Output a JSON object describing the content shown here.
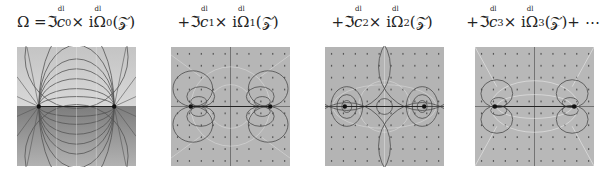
{
  "figure": {
    "panels": [
      {
        "id": "p0",
        "caption": {
          "prefix": "Ω = ",
          "op": "ℑ",
          "coef": "c",
          "index": "0",
          "sup": "dl",
          "mid": " × i",
          "omega": "Ω",
          "suffix": "(𝒵)",
          "trail": ""
        },
        "description": "Dipole field between two point singularities; coordinate-grid field lines, lower half darker shading"
      },
      {
        "id": "p1",
        "caption": {
          "prefix": "+",
          "op": "ℑ",
          "coef": "c",
          "index": "1",
          "sup": "dl",
          "mid": " × i",
          "omega": "Ω",
          "suffix": "(𝒵)",
          "trail": ""
        },
        "description": "First-order correction: looped contours around each singularity"
      },
      {
        "id": "p2",
        "caption": {
          "prefix": "+",
          "op": "ℑ",
          "coef": "c",
          "index": "2",
          "sup": "dl",
          "mid": " × i",
          "omega": "Ω",
          "suffix": "(𝒵)",
          "trail": ""
        },
        "description": "Second-order correction: large circles and central small circle"
      },
      {
        "id": "p3",
        "caption": {
          "prefix": "+",
          "op": "ℑ",
          "coef": "c",
          "index": "3",
          "sup": "dl",
          "mid": " × i",
          "omega": "Ω",
          "suffix": "(𝒵)",
          "trail": " + ⋯"
        },
        "description": "Third-order correction: compact loops near singularities with diagonal white lines"
      }
    ],
    "colors": {
      "panel_bg": "#b4b4b4",
      "panel_light": "#cfcfcf",
      "panel_dark": "#8a8a8a",
      "line_dark": "#4a4a4a",
      "line_light": "#e8e8e8",
      "singularity": "#111111"
    }
  }
}
